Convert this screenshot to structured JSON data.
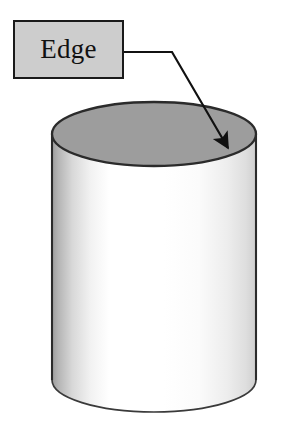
{
  "figure": {
    "kind": "geometry-diagram",
    "background_color": "#ffffff",
    "width": 307,
    "height": 437
  },
  "callout": {
    "label": "Edge",
    "box": {
      "fill_color": "#cdcdcd",
      "border_color": "#1a1a1a",
      "x": 13,
      "y": 20,
      "width": 111,
      "height": 59
    },
    "leader": {
      "color": "#111111",
      "start_x": 124,
      "start_y": 52,
      "bend_x": 172,
      "bend_y": 52,
      "tip_x": 233,
      "tip_y": 157,
      "arrowhead": "filled-triangle"
    }
  },
  "cylinder": {
    "outline_color": "#2b2b2b",
    "top_face_fill": "#9d9d9d",
    "body_highlight": "#ffffff",
    "body_shadow": "#b8b8b8",
    "left_x": 52,
    "right_x": 256,
    "top_ellipse_center_y": 134,
    "top_ellipse_ry": 32,
    "body_bottom_y": 380,
    "bottom_ellipse_ry": 32,
    "parts": [
      {
        "name": "top-face",
        "description": "shaded elliptical top face"
      },
      {
        "name": "lateral-surface",
        "description": "curved side with gradient shading"
      },
      {
        "name": "top-edge",
        "description": "circular edge indicated by the callout arrow"
      },
      {
        "name": "bottom-edge",
        "description": "front bottom arc of the cylinder"
      }
    ]
  }
}
